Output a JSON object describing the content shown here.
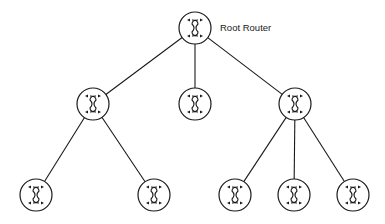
{
  "diagram": {
    "title_label": "Root Router",
    "colors": {
      "stroke": "#1a1a1a",
      "background": "#ffffff"
    },
    "node_radius": 16,
    "nodes": [
      {
        "id": "root",
        "x": 195,
        "y": 28,
        "label": "Root Router"
      },
      {
        "id": "l1-left",
        "x": 93,
        "y": 104
      },
      {
        "id": "l1-mid",
        "x": 195,
        "y": 104
      },
      {
        "id": "l1-right",
        "x": 295,
        "y": 104
      },
      {
        "id": "l2-a",
        "x": 36,
        "y": 195
      },
      {
        "id": "l2-b",
        "x": 154,
        "y": 195
      },
      {
        "id": "l2-c",
        "x": 235,
        "y": 195
      },
      {
        "id": "l2-d",
        "x": 294,
        "y": 195
      },
      {
        "id": "l2-e",
        "x": 353,
        "y": 195
      }
    ],
    "edges": [
      [
        "root",
        "l1-left"
      ],
      [
        "root",
        "l1-mid"
      ],
      [
        "root",
        "l1-right"
      ],
      [
        "l1-left",
        "l2-a"
      ],
      [
        "l1-left",
        "l2-b"
      ],
      [
        "l1-right",
        "l2-c"
      ],
      [
        "l1-right",
        "l2-d"
      ],
      [
        "l1-right",
        "l2-e"
      ]
    ],
    "icon": "router-icon"
  }
}
